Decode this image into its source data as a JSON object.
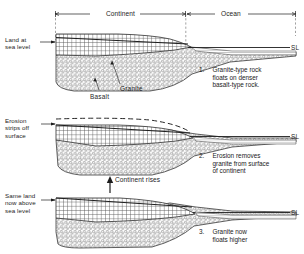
{
  "figure": {
    "title_spans": [
      {
        "label": "Continent",
        "x1": 55,
        "x2": 186
      },
      {
        "label": "Ocean",
        "x1": 186,
        "x2": 296
      }
    ],
    "sea_level_marker": "SL",
    "panels": [
      {
        "id": "panel-1",
        "left_caption": "Land at\nsea level",
        "number": "1.",
        "caption": "Granite-type rock\nfloats on denser\nbasalt-type rock.",
        "rock_labels": [
          {
            "name": "Granite",
            "x": 120,
            "y": 86
          },
          {
            "name": "Basalt",
            "x": 92,
            "y": 94
          }
        ]
      },
      {
        "id": "panel-2",
        "left_caption": "Erosion\nstrips off\nsurface",
        "number": "2.",
        "caption": "Erosion removes\ngranite from surface\nof continent",
        "rock_labels": []
      },
      {
        "id": "panel-3",
        "left_caption": "Same land\nnow above\nsea level",
        "number": "3.",
        "caption": "Granite now\nfloats higher",
        "annotation": "Continent rises",
        "rock_labels": []
      }
    ],
    "colors": {
      "ink": "#1d1d1d",
      "hatch": "#4a4a4a",
      "stipple": "#6b6b6b",
      "background": "#ffffff"
    }
  }
}
